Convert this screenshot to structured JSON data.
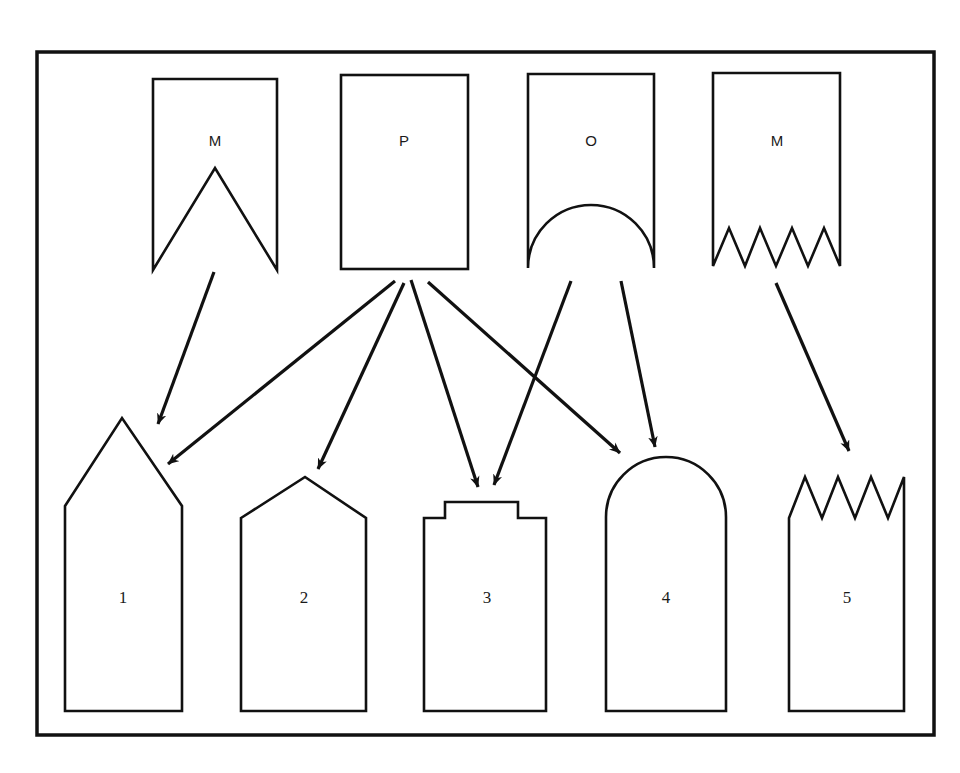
{
  "figure": {
    "type": "diagram",
    "frame": {
      "stroke_color": "#111111",
      "border_width": 3
    },
    "line_color": "#111111",
    "background_color": "#ffffff"
  },
  "top_shapes": [
    {
      "id": "top-m-notch",
      "label": "M",
      "form": "rectangle-with-v-notch-bottom"
    },
    {
      "id": "top-p-rect",
      "label": "P",
      "form": "plain-rectangle"
    },
    {
      "id": "top-o-arch",
      "label": "O",
      "form": "rectangle-with-semicircular-notch-bottom"
    },
    {
      "id": "top-m-zigzag",
      "label": "M",
      "form": "rectangle-with-sawtooth-bottom"
    }
  ],
  "bottom_shapes": [
    {
      "id": "bottom-1",
      "label": "1",
      "form": "house-with-tall-pointed-gable"
    },
    {
      "id": "bottom-2",
      "label": "2",
      "form": "house-with-shallow-gable"
    },
    {
      "id": "bottom-3",
      "label": "3",
      "form": "rectangle-with-raised-top-tab"
    },
    {
      "id": "bottom-4",
      "label": "4",
      "form": "rectangle-with-arched-top"
    },
    {
      "id": "bottom-5",
      "label": "5",
      "form": "rectangle-with-sawtooth-top"
    }
  ],
  "arrows": [
    {
      "id": "arrow-m1-to-1",
      "from": "top-m-notch",
      "to": "bottom-1"
    },
    {
      "id": "arrow-p-to-1",
      "from": "top-p-rect",
      "to": "bottom-1"
    },
    {
      "id": "arrow-p-to-2",
      "from": "top-p-rect",
      "to": "bottom-2"
    },
    {
      "id": "arrow-p-to-3",
      "from": "top-p-rect",
      "to": "bottom-3"
    },
    {
      "id": "arrow-p-to-4",
      "from": "top-p-rect",
      "to": "bottom-4"
    },
    {
      "id": "arrow-o-to-3",
      "from": "top-o-arch",
      "to": "bottom-3"
    },
    {
      "id": "arrow-o-to-4",
      "from": "top-o-arch",
      "to": "bottom-4"
    },
    {
      "id": "arrow-m2-to-5",
      "from": "top-m-zigzag",
      "to": "bottom-5"
    }
  ],
  "caption_fragment": {
    "note": "Partially cropped caption text at the left edge of the page; only the final letters of each line are visible.",
    "lines": [
      "s",
      "y-",
      "=",
      "e",
      "e",
      "y",
      "o",
      "y-",
      "0,",
      "n-",
      "3.",
      "o."
    ]
  }
}
